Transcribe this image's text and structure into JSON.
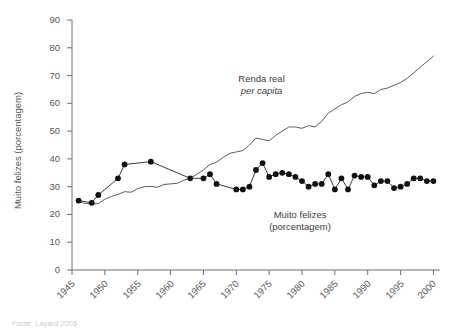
{
  "chart_data": {
    "type": "line",
    "title": "",
    "subtitle": "",
    "xlabel": "",
    "ylabel": "Muito felizes (porcentagem)",
    "xlim": [
      1945,
      2001
    ],
    "ylim": [
      0,
      90
    ],
    "xticks": [
      1945,
      1950,
      1955,
      1960,
      1965,
      1970,
      1975,
      1980,
      1985,
      1990,
      1995,
      2000
    ],
    "yticks": [
      0,
      10,
      20,
      30,
      40,
      50,
      60,
      70,
      80,
      90
    ],
    "grid": false,
    "legend_position": "inline-annotations",
    "annotations": [
      {
        "name": "renda-real-label",
        "line1": "Renda real",
        "line2": "per capita",
        "line2_italic": true,
        "x": 1977,
        "y": 68
      },
      {
        "name": "muito-felizes-label",
        "line1": "Muito felizes",
        "line2": "(porcentagem)",
        "line2_italic": false,
        "x": 1982,
        "y": 19
      }
    ],
    "series": [
      {
        "name": "Renda real per capita",
        "style": "line",
        "markers": false,
        "x": [
          1946,
          1947,
          1948,
          1949,
          1950,
          1951,
          1952,
          1953,
          1954,
          1955,
          1956,
          1957,
          1958,
          1959,
          1960,
          1961,
          1962,
          1963,
          1964,
          1965,
          1966,
          1967,
          1968,
          1969,
          1970,
          1971,
          1972,
          1973,
          1974,
          1975,
          1976,
          1977,
          1978,
          1979,
          1980,
          1981,
          1982,
          1983,
          1984,
          1985,
          1986,
          1987,
          1988,
          1989,
          1990,
          1991,
          1992,
          1993,
          1994,
          1995,
          1996,
          1997,
          1998,
          1999,
          2000
        ],
        "y": [
          24.5,
          24.0,
          23.8,
          23.9,
          25.5,
          26.5,
          27.2,
          28.2,
          28.0,
          29.3,
          30.0,
          30.1,
          29.8,
          30.8,
          31.0,
          31.2,
          32.3,
          33.0,
          34.5,
          36.0,
          38.0,
          38.8,
          40.5,
          42.0,
          42.5,
          43.0,
          45.0,
          47.5,
          47.0,
          46.5,
          48.5,
          50.0,
          51.5,
          51.5,
          51.0,
          52.0,
          51.5,
          53.5,
          56.5,
          58.0,
          59.5,
          60.5,
          62.5,
          63.5,
          64.0,
          63.5,
          65.0,
          65.5,
          66.5,
          67.5,
          69.0,
          71.0,
          73.0,
          75.0,
          77.0
        ]
      },
      {
        "name": "Muito felizes (porcentagem)",
        "style": "line",
        "markers": true,
        "x": [
          1946,
          1948,
          1949,
          1952,
          1953,
          1957,
          1963,
          1965,
          1966,
          1967,
          1970,
          1971,
          1972,
          1973,
          1974,
          1975,
          1976,
          1977,
          1978,
          1979,
          1980,
          1981,
          1982,
          1983,
          1984,
          1985,
          1986,
          1987,
          1988,
          1989,
          1990,
          1991,
          1992,
          1993,
          1994,
          1995,
          1996,
          1997,
          1998,
          1999,
          2000
        ],
        "y": [
          25.0,
          24.2,
          27.0,
          33.0,
          38.0,
          39.0,
          33.0,
          33.0,
          34.5,
          31.0,
          29.0,
          29.0,
          30.0,
          36.0,
          38.5,
          33.5,
          34.5,
          35.0,
          34.5,
          33.5,
          32.0,
          30.0,
          31.0,
          31.0,
          34.5,
          29.0,
          33.0,
          29.0,
          34.0,
          33.5,
          33.5,
          30.5,
          32.0,
          32.0,
          29.5,
          30.0,
          31.0,
          33.0,
          33.0,
          32.0,
          32.0
        ]
      }
    ]
  },
  "source_note": "Fonte: Layard 2005"
}
